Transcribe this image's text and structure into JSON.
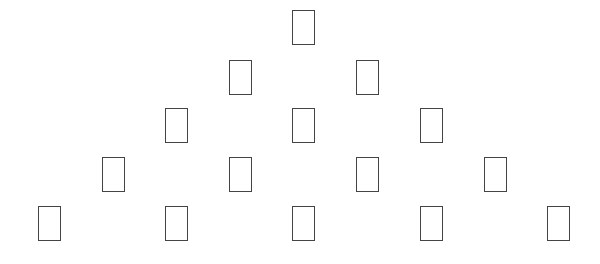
{
  "diagram": {
    "type": "triangular-arrangement",
    "stroke_color": "#444444",
    "background": "#ffffff",
    "node_size": {
      "width": 23,
      "height": 35
    },
    "rows": [
      {
        "top": 10,
        "centers": [
          303
        ]
      },
      {
        "top": 60,
        "centers": [
          240,
          367
        ]
      },
      {
        "top": 108,
        "centers": [
          176,
          303,
          431
        ]
      },
      {
        "top": 157,
        "centers": [
          113,
          240,
          367,
          495
        ]
      },
      {
        "top": 206,
        "centers": [
          49,
          176,
          303,
          431,
          558
        ]
      }
    ]
  }
}
